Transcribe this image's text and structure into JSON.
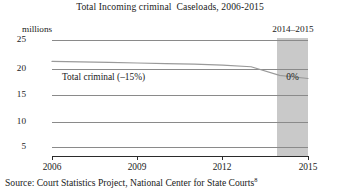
{
  "chart_data": {
    "type": "line",
    "title": "Total Incoming criminal  Caseloads, 2006-2015",
    "xlabel": "",
    "ylabel": "millions",
    "ylim": [
      0,
      25
    ],
    "xlim": [
      2006,
      2015
    ],
    "grid": true,
    "legend": "none",
    "x": [
      2006,
      2007,
      2008,
      2009,
      2010,
      2011,
      2012,
      2013,
      2014,
      2015
    ],
    "series": [
      {
        "name": "Total criminal",
        "values": [
          21.0,
          20.9,
          20.8,
          20.7,
          20.6,
          20.5,
          20.3,
          20.0,
          18.4,
          17.8
        ],
        "annotation": "Total criminal (–15%)",
        "change_pct": "–15%"
      }
    ],
    "ytick_labels": [
      "25",
      "20",
      "15",
      "10",
      "5"
    ],
    "ytick_values": [
      25,
      20,
      15,
      10,
      5
    ],
    "xtick_labels": [
      "2006",
      "2009",
      "2012",
      "2015"
    ],
    "xtick_values": [
      2006,
      2009,
      2012,
      2015
    ],
    "highlight_band": {
      "label": "2014–2015",
      "value_label": "0%",
      "start": 2014,
      "end": 2015,
      "color": "#c9c9c9"
    },
    "colors": {
      "gridline": "#8a8a8a",
      "axis": "#2b2b2b",
      "series_line": "#9a9a9a",
      "band": "#c9c9c9",
      "text": "#1a1a1a"
    }
  },
  "source": {
    "prefix": "Source:  Court Statistics Project, National Center for State Courts",
    "superscript": "8"
  }
}
